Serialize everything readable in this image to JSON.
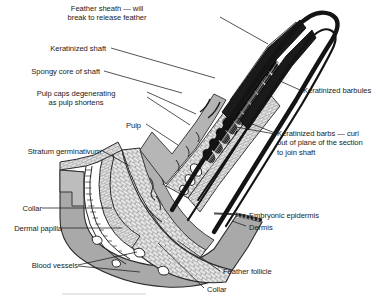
{
  "figure": {
    "type": "anatomical-cross-section",
    "background_color": "#ffffff",
    "ink_color": "#1b1b1b",
    "tones": {
      "dermis_gray": "#a9a9a9",
      "pulp_gray": "#b4b4b4",
      "sheath_black": "#141414",
      "epidermis_light": "#efefef",
      "spongy_core": "#d0d0d0"
    }
  },
  "labels": [
    {
      "id": "feather-sheath",
      "text": "Feather sheath — will\nbreak to release feather",
      "align": "center",
      "x": 107,
      "y": 4
    },
    {
      "id": "keratinized-shaft",
      "text": "Keratinized shaft",
      "align": "right",
      "x": 106,
      "y": 44
    },
    {
      "id": "spongy-core",
      "text": "Spongy core of shaft",
      "align": "right",
      "x": 100,
      "y": 67
    },
    {
      "id": "pulp-caps",
      "text": "Pulp caps degenerating\nas pulp shortens",
      "align": "right",
      "x": 82,
      "y": 89
    },
    {
      "id": "pulp",
      "text": "Pulp",
      "align": "right",
      "x": 141,
      "y": 121
    },
    {
      "id": "stratum-germinativum",
      "text": "Stratum germinativum",
      "align": "right",
      "x": 15,
      "y": 147
    },
    {
      "id": "collar-upper",
      "text": "Collar",
      "align": "right",
      "x": 18,
      "y": 205
    },
    {
      "id": "dermal-papilla",
      "text": "Dermal papilla",
      "align": "right",
      "x": 2,
      "y": 225
    },
    {
      "id": "blood-vessels",
      "text": "Blood vessels",
      "align": "right",
      "x": 32,
      "y": 262
    },
    {
      "id": "keratinized-barbules",
      "text": "Keratinized barbules",
      "align": "left",
      "x": 302,
      "y": 87
    },
    {
      "id": "keratinized-barbs",
      "text": "Keratinized barbs — curl\nout of plane of the section\nto join shaft",
      "align": "left",
      "x": 277,
      "y": 130
    },
    {
      "id": "embryonic-epidermis",
      "text": "Embryonic epidermis",
      "align": "left",
      "x": 248,
      "y": 212
    },
    {
      "id": "dermis",
      "text": "Dermis",
      "align": "left",
      "x": 248,
      "y": 224
    },
    {
      "id": "feather-follicle",
      "text": "Feather follicle",
      "align": "left",
      "x": 222,
      "y": 268
    },
    {
      "id": "collar-lower",
      "text": "Collar",
      "align": "left",
      "x": 206,
      "y": 286
    }
  ],
  "leader_lines": [
    {
      "id": "leader-feather-sheath",
      "from": [
        220,
        17
      ],
      "to": [
        268,
        44
      ]
    },
    {
      "id": "leader-keratinized-shaft",
      "from": [
        111,
        48
      ],
      "to": [
        215,
        78
      ]
    },
    {
      "id": "leader-spongy-core",
      "from": [
        104,
        71
      ],
      "to": [
        182,
        93
      ]
    },
    {
      "id": "leader-pulp-caps-a",
      "from": [
        147,
        92
      ],
      "to": [
        196,
        114
      ]
    },
    {
      "id": "leader-pulp-caps-b",
      "from": [
        147,
        97
      ],
      "to": [
        190,
        125
      ]
    },
    {
      "id": "leader-pulp",
      "from": [
        146,
        124
      ],
      "to": [
        178,
        145
      ]
    },
    {
      "id": "leader-stratum",
      "from": [
        101,
        150
      ],
      "to": [
        130,
        166
      ]
    },
    {
      "id": "leader-collar-upper",
      "from": [
        42,
        208
      ],
      "to": [
        112,
        208
      ]
    },
    {
      "id": "leader-dermal-papilla",
      "from": [
        62,
        228
      ],
      "to": [
        122,
        228
      ]
    },
    {
      "id": "leader-blood-a",
      "from": [
        78,
        265
      ],
      "to": [
        137,
        252
      ]
    },
    {
      "id": "leader-blood-b",
      "from": [
        78,
        266
      ],
      "to": [
        140,
        272
      ]
    },
    {
      "id": "leader-barbules",
      "from": [
        300,
        90
      ],
      "to": [
        262,
        73
      ]
    },
    {
      "id": "leader-barbs-a",
      "from": [
        275,
        133
      ],
      "to": [
        232,
        116
      ]
    },
    {
      "id": "leader-barbs-b",
      "from": [
        275,
        134
      ],
      "to": [
        236,
        127
      ]
    },
    {
      "id": "leader-embryonic",
      "from": [
        246,
        215
      ],
      "to": [
        214,
        214
      ]
    },
    {
      "id": "leader-dermis",
      "from": [
        246,
        226
      ],
      "to": [
        230,
        222
      ]
    },
    {
      "id": "leader-follicle",
      "from": [
        220,
        271
      ],
      "to": [
        178,
        241
      ]
    },
    {
      "id": "leader-collar-lower",
      "from": [
        204,
        288
      ],
      "to": [
        158,
        243
      ]
    }
  ]
}
